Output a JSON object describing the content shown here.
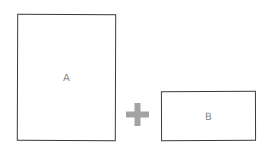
{
  "diagram": {
    "boxes": [
      {
        "id": "A",
        "label": "A"
      },
      {
        "id": "B",
        "label": "B"
      }
    ],
    "operator": {
      "symbol": "+",
      "icon": "plus-icon",
      "color": "#a3a3a3"
    },
    "colors": {
      "stroke": "#3a3a3a",
      "label": "#8a8a8a",
      "background": "#ffffff"
    }
  }
}
